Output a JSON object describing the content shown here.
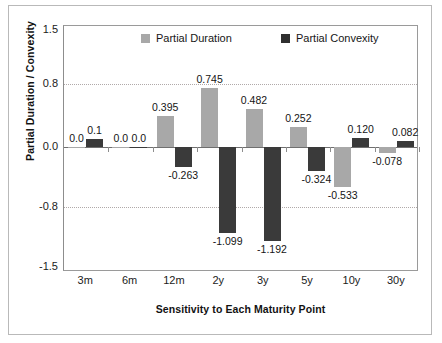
{
  "chart_data": {
    "type": "bar",
    "title": "",
    "xlabel": "Sensitivity to Each Maturity Point",
    "ylabel": "Partial Duration / Convexity",
    "categories": [
      "3m",
      "6m",
      "12m",
      "2y",
      "3y",
      "5y",
      "10y",
      "30y"
    ],
    "series": [
      {
        "name": "Partial Duration",
        "color": "#a8a8a8",
        "values": [
          0.0,
          0.0,
          0.395,
          0.745,
          0.482,
          0.252,
          -0.533,
          -0.078
        ],
        "labels": [
          "0.0",
          "0.0",
          "0.395",
          "0.745",
          "0.482",
          "0.252",
          "-0.533",
          "-0.078"
        ]
      },
      {
        "name": "Partial Convexity",
        "color": "#2f2f2f",
        "values": [
          0.1,
          0.0,
          -0.263,
          -1.099,
          -1.192,
          -0.324,
          0.12,
          0.082
        ],
        "labels": [
          "0.1",
          "0.0",
          "-0.263",
          "-1.099",
          "-1.192",
          "-0.324",
          "0.120",
          "0.082"
        ]
      }
    ],
    "ylim": [
      -1.5,
      1.5
    ],
    "yticks": [
      1.5,
      0.8,
      0.0,
      -0.8,
      -1.5
    ],
    "ytick_labels": [
      "1.5",
      "0.8",
      "0.0",
      "-0.8",
      "-1.5"
    ],
    "gridlines": [
      0.8,
      -0.8
    ],
    "grid": true,
    "legend_position": "top-inside"
  },
  "legend": {
    "items": [
      {
        "label": "Partial Duration",
        "swatch": "duration-swatch"
      },
      {
        "label": "Partial Convexity",
        "swatch": "convexity-swatch"
      }
    ]
  }
}
